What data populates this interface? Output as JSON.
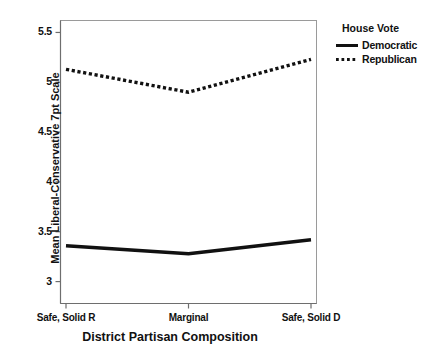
{
  "chart_data": {
    "type": "line",
    "title": "",
    "xlabel": "District Partisan Composition",
    "ylabel": "Mean Liberal-Conservative 7pt Scale",
    "categories": [
      "Safe, Solid R",
      "Marginal",
      "Safe, Solid D"
    ],
    "ylim": [
      2.78,
      5.62
    ],
    "yticks": [
      3,
      3.5,
      4,
      4.5,
      5,
      5.5
    ],
    "ytick_labels": [
      "3",
      "3.5",
      "4",
      "4.5",
      "5",
      "5.5"
    ],
    "grid": false,
    "legend_position": "right",
    "series": [
      {
        "name": "Democratic",
        "values": [
          3.36,
          3.28,
          3.42
        ],
        "style": "solid",
        "color": "#111111"
      },
      {
        "name": "Republican",
        "values": [
          5.13,
          4.9,
          5.23
        ],
        "style": "dotted",
        "color": "#111111"
      }
    ]
  },
  "legend": {
    "title": "House Vote",
    "entries": [
      {
        "label": "Democratic",
        "style": "solid"
      },
      {
        "label": "Republican",
        "style": "dotted"
      }
    ]
  },
  "axes": {
    "y_title": "Mean Liberal-Conservative 7pt Scale",
    "x_title": "District Partisan Composition",
    "y_tick_labels": [
      "5.5",
      "5",
      "4.5",
      "4",
      "3.5",
      "3"
    ],
    "x_tick_labels": [
      "Safe, Solid R",
      "Marginal",
      "Safe, Solid D"
    ]
  }
}
